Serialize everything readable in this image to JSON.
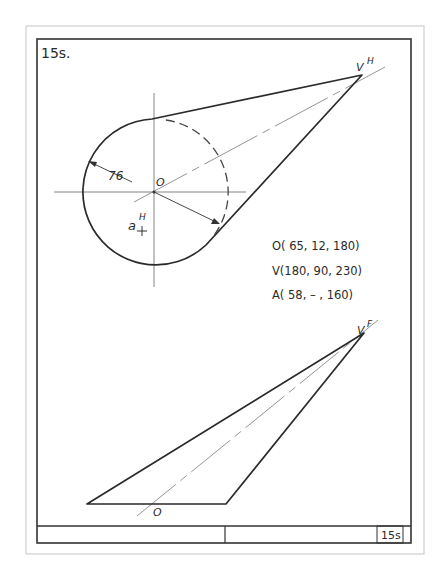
{
  "figure": {
    "label": "15s.",
    "title_block_label": "15s"
  },
  "top_view": {
    "dimension_label": "76",
    "center_label": "O",
    "point_a_label": "a",
    "point_a_superscript": "H",
    "apex_label": "V",
    "apex_superscript": "H"
  },
  "front_view": {
    "apex_label": "V",
    "apex_superscript": "F",
    "center_label": "O"
  },
  "coordinates": [
    {
      "text": "O( 65, 12, 180)"
    },
    {
      "text": "V(180, 90, 230)"
    },
    {
      "text": "A( 58, –  , 160)"
    }
  ],
  "colors": {
    "line": "#2a2a2a",
    "thin_line": "#555555",
    "page_border": "#c8c8c8"
  }
}
